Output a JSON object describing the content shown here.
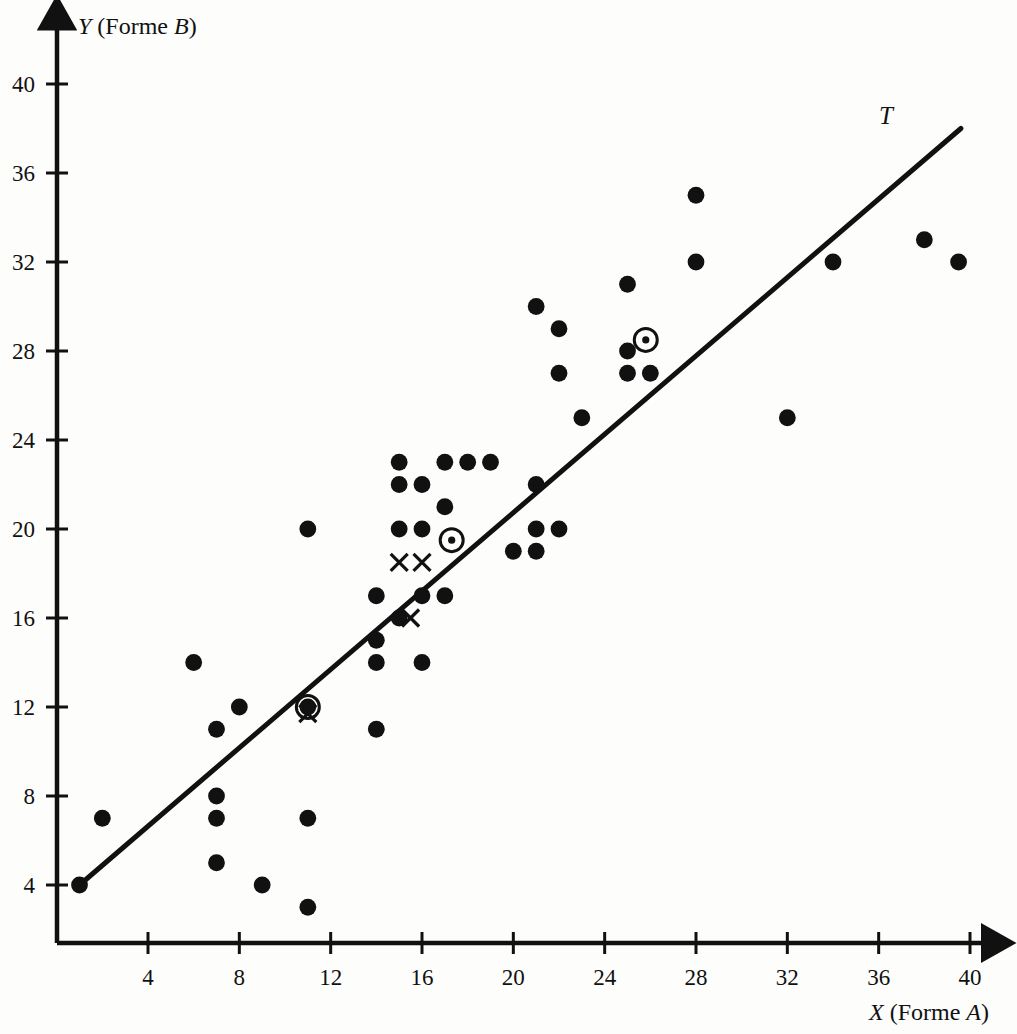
{
  "figure": {
    "background_color": "#fdfdfc",
    "ink_color": "#111111"
  },
  "axes": {
    "x_title_plain_1": "X",
    "x_title_plain_2": " (Forme ",
    "x_title_italic": "A",
    "x_title_plain_3": ")",
    "x_title_full": "X (Forme A)",
    "y_title_plain_1": "Y",
    "y_title_plain_2": " (Forme ",
    "y_title_italic": "B",
    "y_title_plain_3": ")",
    "y_title_full": "Y (Forme B)",
    "x_ticks": [
      4,
      8,
      12,
      16,
      20,
      24,
      28,
      32,
      36,
      40
    ],
    "y_ticks": [
      4,
      8,
      12,
      16,
      20,
      24,
      28,
      32,
      36,
      40
    ]
  },
  "annotations": {
    "trend_line_label": "T"
  },
  "chart_data": {
    "type": "scatter",
    "title": "",
    "xlabel": "X (Forme A)",
    "ylabel": "Y (Forme B)",
    "xlim": [
      0,
      41.5
    ],
    "ylim": [
      0,
      42.5
    ],
    "grid": false,
    "legend": null,
    "series": [
      {
        "name": "observations",
        "marker": "filled-circle",
        "points": [
          [
            1,
            4
          ],
          [
            2,
            7
          ],
          [
            6,
            14
          ],
          [
            7,
            11
          ],
          [
            7,
            8
          ],
          [
            7,
            7
          ],
          [
            7,
            5
          ],
          [
            8,
            12
          ],
          [
            9,
            4
          ],
          [
            11,
            20
          ],
          [
            11,
            12
          ],
          [
            11,
            7
          ],
          [
            11,
            3
          ],
          [
            14,
            17
          ],
          [
            14,
            15
          ],
          [
            14,
            14
          ],
          [
            14,
            11
          ],
          [
            15,
            23
          ],
          [
            15,
            22
          ],
          [
            15,
            20
          ],
          [
            15,
            16
          ],
          [
            16,
            22
          ],
          [
            16,
            20
          ],
          [
            16,
            17
          ],
          [
            16,
            14
          ],
          [
            17,
            23
          ],
          [
            17,
            21
          ],
          [
            17,
            17
          ],
          [
            18,
            23
          ],
          [
            19,
            23
          ],
          [
            20,
            19
          ],
          [
            21,
            30
          ],
          [
            21,
            22
          ],
          [
            21,
            20
          ],
          [
            21,
            19
          ],
          [
            22,
            29
          ],
          [
            22,
            27
          ],
          [
            22,
            20
          ],
          [
            23,
            25
          ],
          [
            25,
            31
          ],
          [
            25,
            28
          ],
          [
            25,
            27
          ],
          [
            26,
            27
          ],
          [
            28,
            35
          ],
          [
            28,
            32
          ],
          [
            32,
            25
          ],
          [
            34,
            32
          ],
          [
            38,
            33
          ],
          [
            39.5,
            32
          ]
        ]
      },
      {
        "name": "x-marks",
        "marker": "cross",
        "points": [
          [
            11,
            11.7
          ],
          [
            15,
            18.5
          ],
          [
            16,
            18.5
          ],
          [
            15.5,
            16
          ]
        ]
      },
      {
        "name": "circled-points",
        "marker": "circled-dot",
        "points": [
          [
            11,
            12
          ],
          [
            17.3,
            19.5
          ],
          [
            25.8,
            28.5
          ]
        ]
      }
    ],
    "trend_line": {
      "label": "T",
      "start": [
        1,
        4
      ],
      "end": [
        39.6,
        38
      ]
    }
  }
}
